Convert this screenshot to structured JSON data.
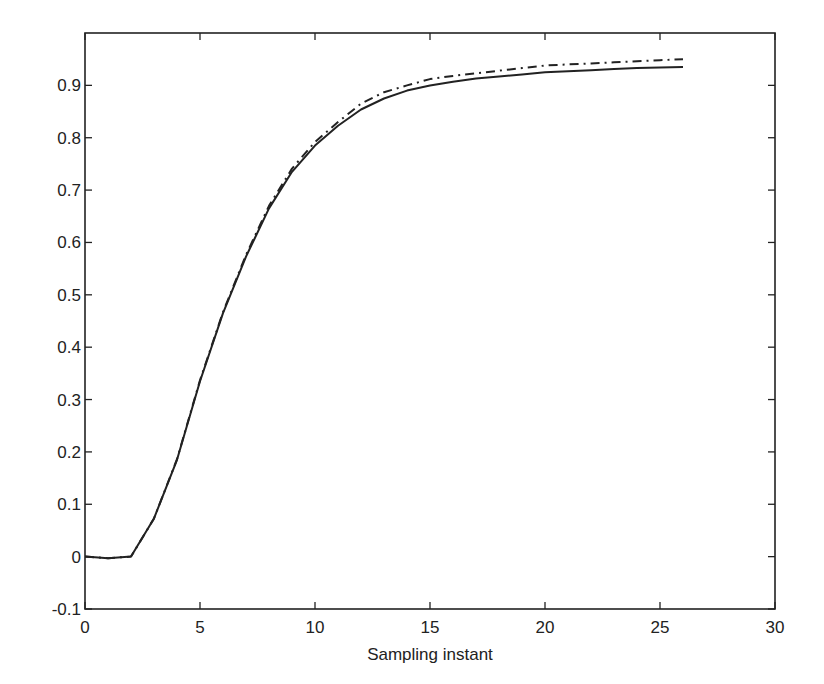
{
  "chart_data": {
    "type": "line",
    "title": "",
    "xlabel": "Sampling instant",
    "ylabel": "",
    "xlim": [
      0,
      30
    ],
    "ylim": [
      -0.1,
      1.0
    ],
    "grid": false,
    "legend": null,
    "x_ticks": [
      0,
      5,
      10,
      15,
      20,
      25,
      30
    ],
    "x_tick_labels": [
      "0",
      "5",
      "10",
      "15",
      "20",
      "25",
      "30"
    ],
    "y_ticks": [
      -0.1,
      0,
      0.1,
      0.2,
      0.3,
      0.4,
      0.5,
      0.6,
      0.7,
      0.8,
      0.9
    ],
    "y_tick_labels": [
      "-0.1",
      "0",
      "0.1",
      "0.2",
      "0.3",
      "0.4",
      "0.5",
      "0.6",
      "0.7",
      "0.8",
      "0.9"
    ],
    "x": [
      0,
      1,
      2,
      3,
      4,
      5,
      6,
      7,
      8,
      9,
      10,
      11,
      12,
      13,
      14,
      15,
      16,
      17,
      18,
      19,
      20,
      21,
      22,
      23,
      24,
      25,
      26
    ],
    "series": [
      {
        "name": "solid",
        "style": "solid",
        "color": "#222222",
        "values": [
          0,
          -0.003,
          0,
          0.073,
          0.185,
          0.335,
          0.465,
          0.573,
          0.665,
          0.735,
          0.785,
          0.823,
          0.854,
          0.875,
          0.89,
          0.9,
          0.907,
          0.913,
          0.917,
          0.921,
          0.925,
          0.927,
          0.929,
          0.931,
          0.933,
          0.934,
          0.935
        ]
      },
      {
        "name": "dash-dot",
        "style": "dashdot",
        "color": "#222222",
        "values": [
          0,
          -0.003,
          0,
          0.073,
          0.186,
          0.337,
          0.467,
          0.576,
          0.67,
          0.741,
          0.792,
          0.83,
          0.865,
          0.887,
          0.9,
          0.912,
          0.918,
          0.923,
          0.928,
          0.933,
          0.938,
          0.94,
          0.942,
          0.944,
          0.946,
          0.948,
          0.95
        ]
      }
    ]
  }
}
